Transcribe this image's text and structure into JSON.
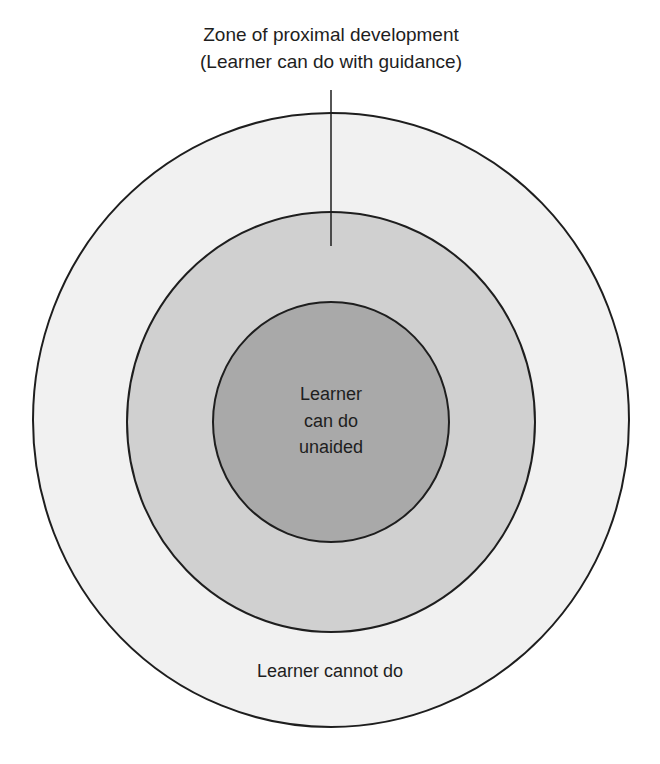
{
  "diagram": {
    "zpd_label": {
      "line1": "Zone of proximal development",
      "line2": "(Learner can do with guidance)"
    },
    "inner_label": {
      "line1": "Learner",
      "line2": "can do",
      "line3": "unaided"
    },
    "outer_label": "Learner cannot do",
    "colors": {
      "outer_fill": "#f1f1f1",
      "middle_fill": "#d0d0d0",
      "inner_fill": "#a9a9a9",
      "stroke": "#1e1e1e"
    }
  }
}
